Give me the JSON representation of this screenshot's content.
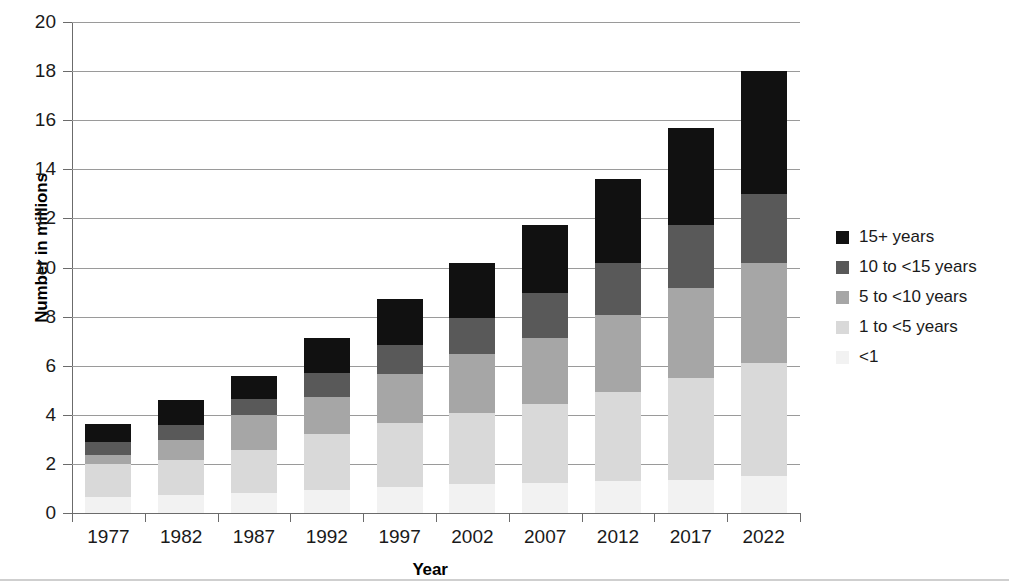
{
  "axes": {
    "ylabel": "Number in millions",
    "xlabel": "Year",
    "yticks": [
      "0",
      "2",
      "4",
      "6",
      "8",
      "10",
      "12",
      "14",
      "16",
      "18",
      "20"
    ],
    "ymin": 0,
    "ymax": 20,
    "ystep": 2
  },
  "legend": {
    "items": [
      {
        "label": "15+ years",
        "color": "#111111"
      },
      {
        "label": "10 to <15 years",
        "color": "#595959"
      },
      {
        "label": "5 to <10 years",
        "color": "#a6a6a6"
      },
      {
        "label": "1 to <5 years",
        "color": "#d9d9d9"
      },
      {
        "label": "<1",
        "color": "#f2f2f2"
      }
    ]
  },
  "chart_data": {
    "type": "bar",
    "stacked": true,
    "title": "",
    "xlabel": "Year",
    "ylabel": "Number in millions",
    "ylim": [
      0,
      20
    ],
    "yticks": [
      0,
      2,
      4,
      6,
      8,
      10,
      12,
      14,
      16,
      18,
      20
    ],
    "grid": true,
    "legend_position": "right",
    "categories": [
      "1977",
      "1982",
      "1987",
      "1992",
      "1997",
      "2002",
      "2007",
      "2012",
      "2017",
      "2022"
    ],
    "series": [
      {
        "name": "<1",
        "color": "#f2f2f2",
        "values": [
          0.65,
          0.73,
          0.8,
          0.94,
          1.05,
          1.18,
          1.21,
          1.29,
          1.34,
          1.52
        ]
      },
      {
        "name": "1 to <5 years",
        "color": "#d9d9d9",
        "values": [
          1.35,
          1.43,
          1.77,
          2.28,
          2.62,
          2.89,
          3.23,
          3.64,
          4.16,
          4.58
        ]
      },
      {
        "name": "5 to <10 years",
        "color": "#a6a6a6",
        "values": [
          0.36,
          0.81,
          1.42,
          1.51,
          1.99,
          2.41,
          2.69,
          3.14,
          3.67,
          4.1
        ]
      },
      {
        "name": "10 to <15 years",
        "color": "#595959",
        "values": [
          0.53,
          0.61,
          0.65,
          0.97,
          1.18,
          1.46,
          1.83,
          2.11,
          2.56,
          2.8
        ]
      },
      {
        "name": "15+ years",
        "color": "#111111",
        "values": [
          0.74,
          1.02,
          0.94,
          1.43,
          1.88,
          2.24,
          2.77,
          3.42,
          3.95,
          5.0
        ]
      }
    ],
    "totals": [
      3.63,
      4.6,
      5.58,
      7.13,
      8.72,
      10.18,
      11.73,
      13.6,
      15.68,
      18.0
    ]
  }
}
